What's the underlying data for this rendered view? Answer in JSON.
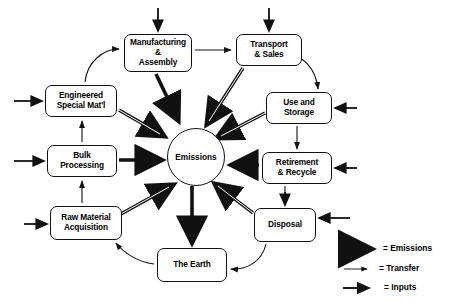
{
  "diagram": {
    "background_color": "#ffffff",
    "line_color": "#111111",
    "nodes": [
      {
        "id": "manufacturing",
        "label": "Manufacturing\n&\nAssembly",
        "x": 124,
        "y": 34,
        "w": 68,
        "h": 38
      },
      {
        "id": "transport",
        "label": "Transport\n& Sales",
        "x": 236,
        "y": 34,
        "w": 66,
        "h": 32
      },
      {
        "id": "use_storage",
        "label": "Use and\nStorage",
        "x": 266,
        "y": 92,
        "w": 66,
        "h": 32
      },
      {
        "id": "retirement",
        "label": "Retirement\n& Recycle",
        "x": 262,
        "y": 152,
        "w": 70,
        "h": 32
      },
      {
        "id": "disposal",
        "label": "Disposal",
        "x": 254,
        "y": 208,
        "w": 62,
        "h": 34
      },
      {
        "id": "the_earth",
        "label": "The Earth",
        "x": 157,
        "y": 248,
        "w": 70,
        "h": 34
      },
      {
        "id": "raw_material",
        "label": "Raw Material\nAcquisition",
        "x": 50,
        "y": 206,
        "w": 72,
        "h": 34
      },
      {
        "id": "bulk_processing",
        "label": "Bulk\nProcessing",
        "x": 47,
        "y": 145,
        "w": 70,
        "h": 32
      },
      {
        "id": "engineered",
        "label": "Engineered\nSpecial Mat'l",
        "x": 45,
        "y": 85,
        "w": 72,
        "h": 32
      }
    ],
    "hub": {
      "id": "emissions",
      "label": "Emissions",
      "cx": 196,
      "cy": 157,
      "r": 29
    },
    "legend": {
      "x": 330,
      "y": 240,
      "items": [
        {
          "id": "legend-emissions",
          "label": "= Emissions",
          "arrow": "thick"
        },
        {
          "id": "legend-transfer",
          "label": "= Transfer",
          "arrow": "thin"
        },
        {
          "id": "legend-inputs",
          "label": "= Inputs",
          "arrow": "medium"
        }
      ]
    }
  }
}
